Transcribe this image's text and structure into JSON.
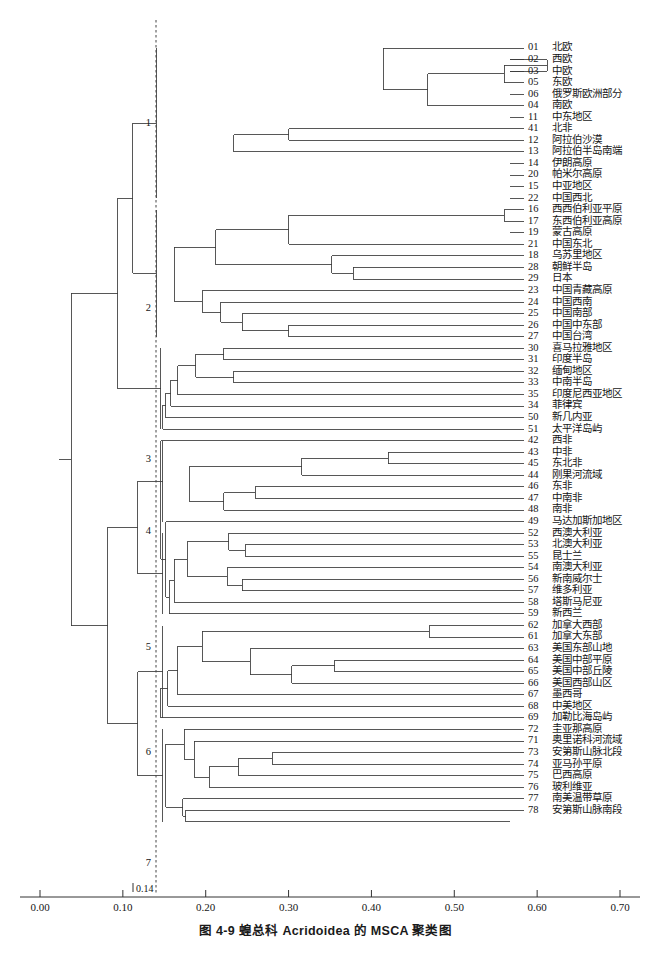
{
  "figure": {
    "caption": "图 4-9  蝗总科 Acridoidea 的 MSCA 聚类图",
    "cut_label": "0.14"
  },
  "axis": {
    "ticks": [
      "0.00",
      "0.10",
      "0.20",
      "0.30",
      "0.40",
      "0.50",
      "0.60",
      "0.70"
    ],
    "tick_values": [
      0.0,
      0.1,
      0.2,
      0.3,
      0.4,
      0.5,
      0.6,
      0.7
    ],
    "min": 0.0,
    "max": 0.7,
    "cut_value": 0.14
  },
  "clusters": [
    {
      "num": "1",
      "y": 124
    },
    {
      "num": "2",
      "y": 309
    },
    {
      "num": "3",
      "y": 460
    },
    {
      "num": "4",
      "y": 532
    },
    {
      "num": "5",
      "y": 648
    },
    {
      "num": "6",
      "y": 753
    },
    {
      "num": "7",
      "y": 864
    }
  ],
  "chart_data": {
    "type": "dendrogram",
    "title": "图 4-9  蝗总科 Acridoidea 的 MSCA 聚类图",
    "xlabel": "",
    "ylabel": "",
    "xlim": [
      0.0,
      0.7
    ],
    "grid": false,
    "cut_line": 0.14,
    "n_leaves": 78,
    "leaves": [
      {
        "code": "01",
        "name": "北欧",
        "cluster": "1"
      },
      {
        "code": "02",
        "name": "西欧",
        "cluster": "1"
      },
      {
        "code": "03",
        "name": "中欧",
        "cluster": "1"
      },
      {
        "code": "05",
        "name": "东欧",
        "cluster": "1"
      },
      {
        "code": "06",
        "name": "俄罗斯欧洲部分",
        "cluster": "1"
      },
      {
        "code": "04",
        "name": "南欧",
        "cluster": "1"
      },
      {
        "code": "11",
        "name": "中东地区",
        "cluster": "1"
      },
      {
        "code": "41",
        "name": "北非",
        "cluster": "1"
      },
      {
        "code": "12",
        "name": "阿拉伯沙漠",
        "cluster": "1"
      },
      {
        "code": "13",
        "name": "阿拉伯半岛南端",
        "cluster": "1"
      },
      {
        "code": "14",
        "name": "伊朗高原",
        "cluster": "1"
      },
      {
        "code": "20",
        "name": "帕米尔高原",
        "cluster": "1"
      },
      {
        "code": "15",
        "name": "中亚地区",
        "cluster": "1"
      },
      {
        "code": "22",
        "name": "中国西北",
        "cluster": "1"
      },
      {
        "code": "16",
        "name": "西西伯利亚平原",
        "cluster": "2"
      },
      {
        "code": "17",
        "name": "东西伯利亚高原",
        "cluster": "2"
      },
      {
        "code": "19",
        "name": "蒙古高原",
        "cluster": "2"
      },
      {
        "code": "21",
        "name": "中国东北",
        "cluster": "2"
      },
      {
        "code": "18",
        "name": "乌苏里地区",
        "cluster": "2"
      },
      {
        "code": "28",
        "name": "朝鲜半岛",
        "cluster": "2"
      },
      {
        "code": "29",
        "name": "日本",
        "cluster": "2"
      },
      {
        "code": "23",
        "name": "中国青藏高原",
        "cluster": "2"
      },
      {
        "code": "24",
        "name": "中国西南",
        "cluster": "2"
      },
      {
        "code": "25",
        "name": "中国南部",
        "cluster": "2"
      },
      {
        "code": "26",
        "name": "中国中东部",
        "cluster": "2"
      },
      {
        "code": "27",
        "name": "中国台湾",
        "cluster": "2"
      },
      {
        "code": "30",
        "name": "喜马拉雅地区",
        "cluster": "3"
      },
      {
        "code": "31",
        "name": "印度半岛",
        "cluster": "3"
      },
      {
        "code": "32",
        "name": "缅甸地区",
        "cluster": "3"
      },
      {
        "code": "33",
        "name": "中南半岛",
        "cluster": "3"
      },
      {
        "code": "35",
        "name": "印度尼西亚地区",
        "cluster": "3"
      },
      {
        "code": "34",
        "name": "菲律宾",
        "cluster": "3"
      },
      {
        "code": "50",
        "name": "新几内亚",
        "cluster": "3"
      },
      {
        "code": "51",
        "name": "太平洋岛屿",
        "cluster": "3"
      },
      {
        "code": "42",
        "name": "西非",
        "cluster": "4"
      },
      {
        "code": "43",
        "name": "中非",
        "cluster": "4"
      },
      {
        "code": "45",
        "name": "东北非",
        "cluster": "4"
      },
      {
        "code": "44",
        "name": "刚果河流域",
        "cluster": "4"
      },
      {
        "code": "46",
        "name": "东非",
        "cluster": "4"
      },
      {
        "code": "47",
        "name": "中南非",
        "cluster": "4"
      },
      {
        "code": "48",
        "name": "南非",
        "cluster": "4"
      },
      {
        "code": "49",
        "name": "马达加斯加地区",
        "cluster": "4"
      },
      {
        "code": "52",
        "name": "西澳大利亚",
        "cluster": "5"
      },
      {
        "code": "53",
        "name": "北澳大利亚",
        "cluster": "5"
      },
      {
        "code": "55",
        "name": "昆士兰",
        "cluster": "5"
      },
      {
        "code": "54",
        "name": "南澳大利亚",
        "cluster": "5"
      },
      {
        "code": "56",
        "name": "新南威尔士",
        "cluster": "5"
      },
      {
        "code": "57",
        "name": "维多利亚",
        "cluster": "5"
      },
      {
        "code": "58",
        "name": "塔斯马尼亚",
        "cluster": "5"
      },
      {
        "code": "59",
        "name": "新西兰",
        "cluster": "5"
      },
      {
        "code": "62",
        "name": "加拿大西部",
        "cluster": "6"
      },
      {
        "code": "61",
        "name": "加拿大东部",
        "cluster": "6"
      },
      {
        "code": "63",
        "name": "美国东部山地",
        "cluster": "6"
      },
      {
        "code": "64",
        "name": "美国中部平原",
        "cluster": "6"
      },
      {
        "code": "65",
        "name": "美国中部丘陵",
        "cluster": "6"
      },
      {
        "code": "66",
        "name": "美国西部山区",
        "cluster": "6"
      },
      {
        "code": "67",
        "name": "墨西哥",
        "cluster": "6"
      },
      {
        "code": "68",
        "name": "中美地区",
        "cluster": "6"
      },
      {
        "code": "69",
        "name": "加勒比海岛屿",
        "cluster": "6"
      },
      {
        "code": "72",
        "name": "圭亚那高原",
        "cluster": "7"
      },
      {
        "code": "71",
        "name": "奥里诺科河流域",
        "cluster": "7"
      },
      {
        "code": "73",
        "name": "安第斯山脉北段",
        "cluster": "7"
      },
      {
        "code": "74",
        "name": "亚马孙平原",
        "cluster": "7"
      },
      {
        "code": "75",
        "name": "巴西高原",
        "cluster": "7"
      },
      {
        "code": "76",
        "name": "玻利维亚",
        "cluster": "7"
      },
      {
        "code": "77",
        "name": "南美温带草原",
        "cluster": "7"
      },
      {
        "code": "78",
        "name": "安第斯山脉南段",
        "cluster": "7"
      }
    ],
    "merges": [
      {
        "x": 0.612,
        "children": [
          1,
          2
        ]
      },
      {
        "x": 0.56,
        "children": [
          [
            0.612
          ],
          3
        ]
      },
      {
        "x": 0.468,
        "children": [
          [
            0.56
          ],
          5
        ]
      },
      {
        "x": 0.414,
        "children": [
          0,
          [
            0.468
          ]
        ]
      },
      {
        "x": 0.272,
        "children": [
          [
            0.414
          ],
          "A"
        ]
      },
      {
        "x": 0.3,
        "children": [
          7,
          8
        ]
      },
      {
        "x": 0.234,
        "children": [
          [
            0.3
          ],
          9
        ]
      },
      {
        "x": 0.196,
        "children": [
          [
            0.272
          ],
          [
            0.234
          ]
        ]
      },
      {
        "x": 0.56,
        "children": [
          14,
          15
        ]
      },
      {
        "x": 0.3,
        "children": [
          [
            0.56
          ],
          17
        ]
      },
      {
        "x": 0.378,
        "children": [
          19,
          20
        ]
      },
      {
        "x": 0.352,
        "children": [
          18,
          [
            0.378
          ]
        ]
      },
      {
        "x": 0.212,
        "children": [
          [
            0.3
          ],
          [
            0.352
          ]
        ]
      },
      {
        "x": 0.3,
        "children": [
          24,
          25
        ]
      },
      {
        "x": 0.244,
        "children": [
          23,
          [
            0.3
          ]
        ]
      },
      {
        "x": 0.218,
        "children": [
          22,
          [
            0.244
          ]
        ]
      },
      {
        "x": 0.196,
        "children": [
          21,
          [
            0.218
          ]
        ]
      },
      {
        "x": 0.162,
        "children": [
          [
            0.212
          ],
          [
            0.196
          ]
        ]
      },
      {
        "x": 0.222,
        "children": [
          26,
          27
        ]
      },
      {
        "x": 0.234,
        "children": [
          28,
          29
        ]
      },
      {
        "x": 0.188,
        "children": [
          [
            0.222
          ],
          [
            0.234
          ]
        ]
      },
      {
        "x": 0.166,
        "children": [
          [
            0.188
          ],
          30
        ]
      },
      {
        "x": 0.158,
        "children": [
          [
            0.166
          ],
          31
        ]
      },
      {
        "x": 0.152,
        "children": [
          [
            0.158
          ],
          32
        ]
      },
      {
        "x": 0.148,
        "children": [
          [
            0.152
          ],
          33
        ]
      },
      {
        "x": 0.42,
        "children": [
          35,
          36
        ]
      },
      {
        "x": 0.316,
        "children": [
          [
            0.42
          ],
          37
        ]
      },
      {
        "x": 0.26,
        "children": [
          38,
          39
        ]
      },
      {
        "x": 0.222,
        "children": [
          [
            0.26
          ],
          40
        ]
      },
      {
        "x": 0.18,
        "children": [
          [
            0.316
          ],
          [
            0.222
          ]
        ]
      },
      {
        "x": 0.248,
        "children": [
          43,
          44
        ]
      },
      {
        "x": 0.228,
        "children": [
          42,
          [
            0.248
          ]
        ]
      },
      {
        "x": 0.244,
        "children": [
          46,
          47
        ]
      },
      {
        "x": 0.226,
        "children": [
          45,
          [
            0.244
          ]
        ]
      },
      {
        "x": 0.178,
        "children": [
          [
            0.228
          ],
          [
            0.226
          ]
        ]
      },
      {
        "x": 0.162,
        "children": [
          [
            0.178
          ],
          48
        ]
      },
      {
        "x": 0.156,
        "children": [
          [
            0.162
          ],
          49
        ]
      },
      {
        "x": 0.152,
        "children": [
          [
            0.156
          ],
          41
        ]
      },
      {
        "x": 0.146,
        "children": [
          [
            0.152
          ],
          34
        ]
      },
      {
        "x": 0.47,
        "children": [
          50,
          51
        ]
      },
      {
        "x": 0.356,
        "children": [
          53,
          54
        ]
      },
      {
        "x": 0.304,
        "children": [
          [
            0.356
          ],
          55
        ]
      },
      {
        "x": 0.254,
        "children": [
          52,
          [
            0.304
          ]
        ]
      },
      {
        "x": 0.196,
        "children": [
          [
            0.47
          ],
          [
            0.254
          ]
        ]
      },
      {
        "x": 0.166,
        "children": [
          [
            0.196
          ],
          56
        ]
      },
      {
        "x": 0.154,
        "children": [
          [
            0.166
          ],
          57
        ]
      },
      {
        "x": 0.146,
        "children": [
          [
            0.154
          ],
          58
        ]
      },
      {
        "x": 0.28,
        "children": [
          61,
          62
        ]
      },
      {
        "x": 0.24,
        "children": [
          [
            0.28
          ],
          63
        ]
      },
      {
        "x": 0.204,
        "children": [
          [
            0.24
          ],
          64
        ]
      },
      {
        "x": 0.186,
        "children": [
          60,
          [
            0.204
          ]
        ]
      },
      {
        "x": 0.174,
        "children": [
          [
            0.186
          ],
          59
        ]
      },
      {
        "x": 0.176,
        "children": [
          66,
          67
        ]
      },
      {
        "x": 0.172,
        "children": [
          65,
          [
            0.176
          ]
        ]
      },
      {
        "x": 0.152,
        "children": [
          [
            0.174
          ],
          [
            0.172
          ]
        ]
      },
      {
        "x": 0.132,
        "children": [
          [
            0.152
          ],
          "B"
        ]
      },
      {
        "x": 0.114,
        "children": [
          [
            0.132
          ],
          "C"
        ]
      },
      {
        "x": 0.092,
        "children": [
          [
            0.114
          ],
          "D"
        ]
      },
      {
        "x": 0.056,
        "children": [
          [
            0.092
          ],
          "E"
        ]
      }
    ]
  }
}
